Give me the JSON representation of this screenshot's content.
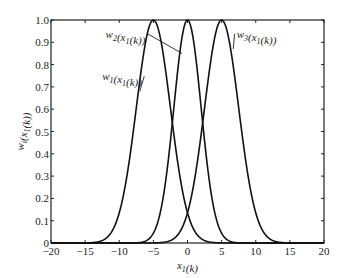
{
  "chart_data": {
    "type": "line",
    "title": "",
    "xlabel": "x1(k)",
    "ylabel": "wi(x1(k))",
    "xlim": [
      -20,
      20
    ],
    "ylim": [
      0,
      1
    ],
    "grid": false,
    "legend": "none (inline annotations)",
    "x_ticks": [
      -20,
      -15,
      -10,
      -5,
      0,
      5,
      10,
      15,
      20
    ],
    "x_tick_labels": [
      "−20",
      "−15",
      "−10",
      "−5",
      "0",
      "5",
      "10",
      "15",
      "20"
    ],
    "y_ticks": [
      0,
      0.1,
      0.2,
      0.3,
      0.4,
      0.5,
      0.6,
      0.7,
      0.8,
      0.9,
      1.0
    ],
    "y_tick_labels": [
      "0",
      "0.1",
      "0.2",
      "0.3",
      "0.4",
      "0.5",
      "0.6",
      "0.7",
      "0.8",
      "0.9",
      "1.0"
    ],
    "series": [
      {
        "name": "w1(x1(k))",
        "kind": "gaussian",
        "center": -5,
        "sigma": 2.5,
        "peak": 1.0
      },
      {
        "name": "w2(x1(k))",
        "kind": "gaussian",
        "center": 0,
        "sigma": 2.0,
        "peak": 1.0
      },
      {
        "name": "w3(x1(k))",
        "kind": "gaussian",
        "center": 5,
        "sigma": 2.5,
        "peak": 1.0
      }
    ],
    "annotations": [
      {
        "series": "w1(x1(k))",
        "text_x": -12.5,
        "text_y": 0.73,
        "point_x": -7.0,
        "point_y": 0.68
      },
      {
        "series": "w2(x1(k))",
        "text_x": -12.0,
        "text_y": 0.92,
        "point_x": -0.8,
        "point_y": 0.85
      },
      {
        "series": "w3(x1(k))",
        "text_x": 7.2,
        "text_y": 0.92,
        "point_x": 6.7,
        "point_y": 0.87
      }
    ]
  }
}
